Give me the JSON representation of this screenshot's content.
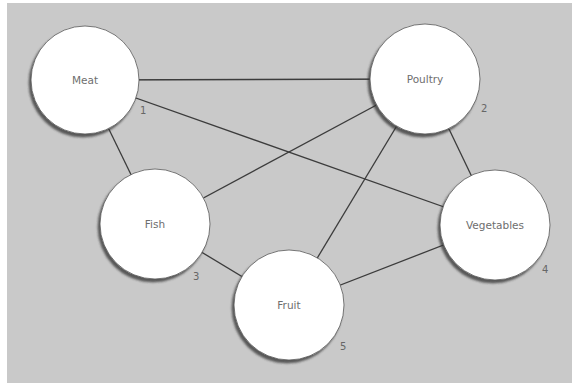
{
  "diagram": {
    "type": "network-graph",
    "background": "#c9c9c9",
    "panel": {
      "x": 7,
      "y": 3,
      "width": 565,
      "height": 380
    },
    "edge_color": "#3c3c3c",
    "node_fill": "#ffffff",
    "nodes": [
      {
        "id": 1,
        "label": "Meat",
        "number": "1",
        "cx": 85,
        "cy": 80,
        "r": 54,
        "num_x": 140,
        "num_y": 114
      },
      {
        "id": 2,
        "label": "Poultry",
        "number": "2",
        "cx": 425,
        "cy": 79,
        "r": 55,
        "num_x": 481,
        "num_y": 112
      },
      {
        "id": 3,
        "label": "Fish",
        "number": "3",
        "cx": 155,
        "cy": 224,
        "r": 55,
        "num_x": 193,
        "num_y": 280
      },
      {
        "id": 4,
        "label": "Vegetables",
        "number": "4",
        "cx": 495,
        "cy": 225,
        "r": 55,
        "num_x": 542,
        "num_y": 273
      },
      {
        "id": 5,
        "label": "Fruit",
        "number": "5",
        "cx": 289,
        "cy": 305,
        "r": 55,
        "num_x": 340,
        "num_y": 350
      }
    ],
    "edges": [
      {
        "from": "Meat",
        "to": "Poultry"
      },
      {
        "from": "Meat",
        "to": "Fish"
      },
      {
        "from": "Meat",
        "to": "Vegetables"
      },
      {
        "from": "Poultry",
        "to": "Fish"
      },
      {
        "from": "Poultry",
        "to": "Fruit"
      },
      {
        "from": "Poultry",
        "to": "Vegetables"
      },
      {
        "from": "Fish",
        "to": "Fruit"
      },
      {
        "from": "Fruit",
        "to": "Vegetables"
      }
    ]
  }
}
